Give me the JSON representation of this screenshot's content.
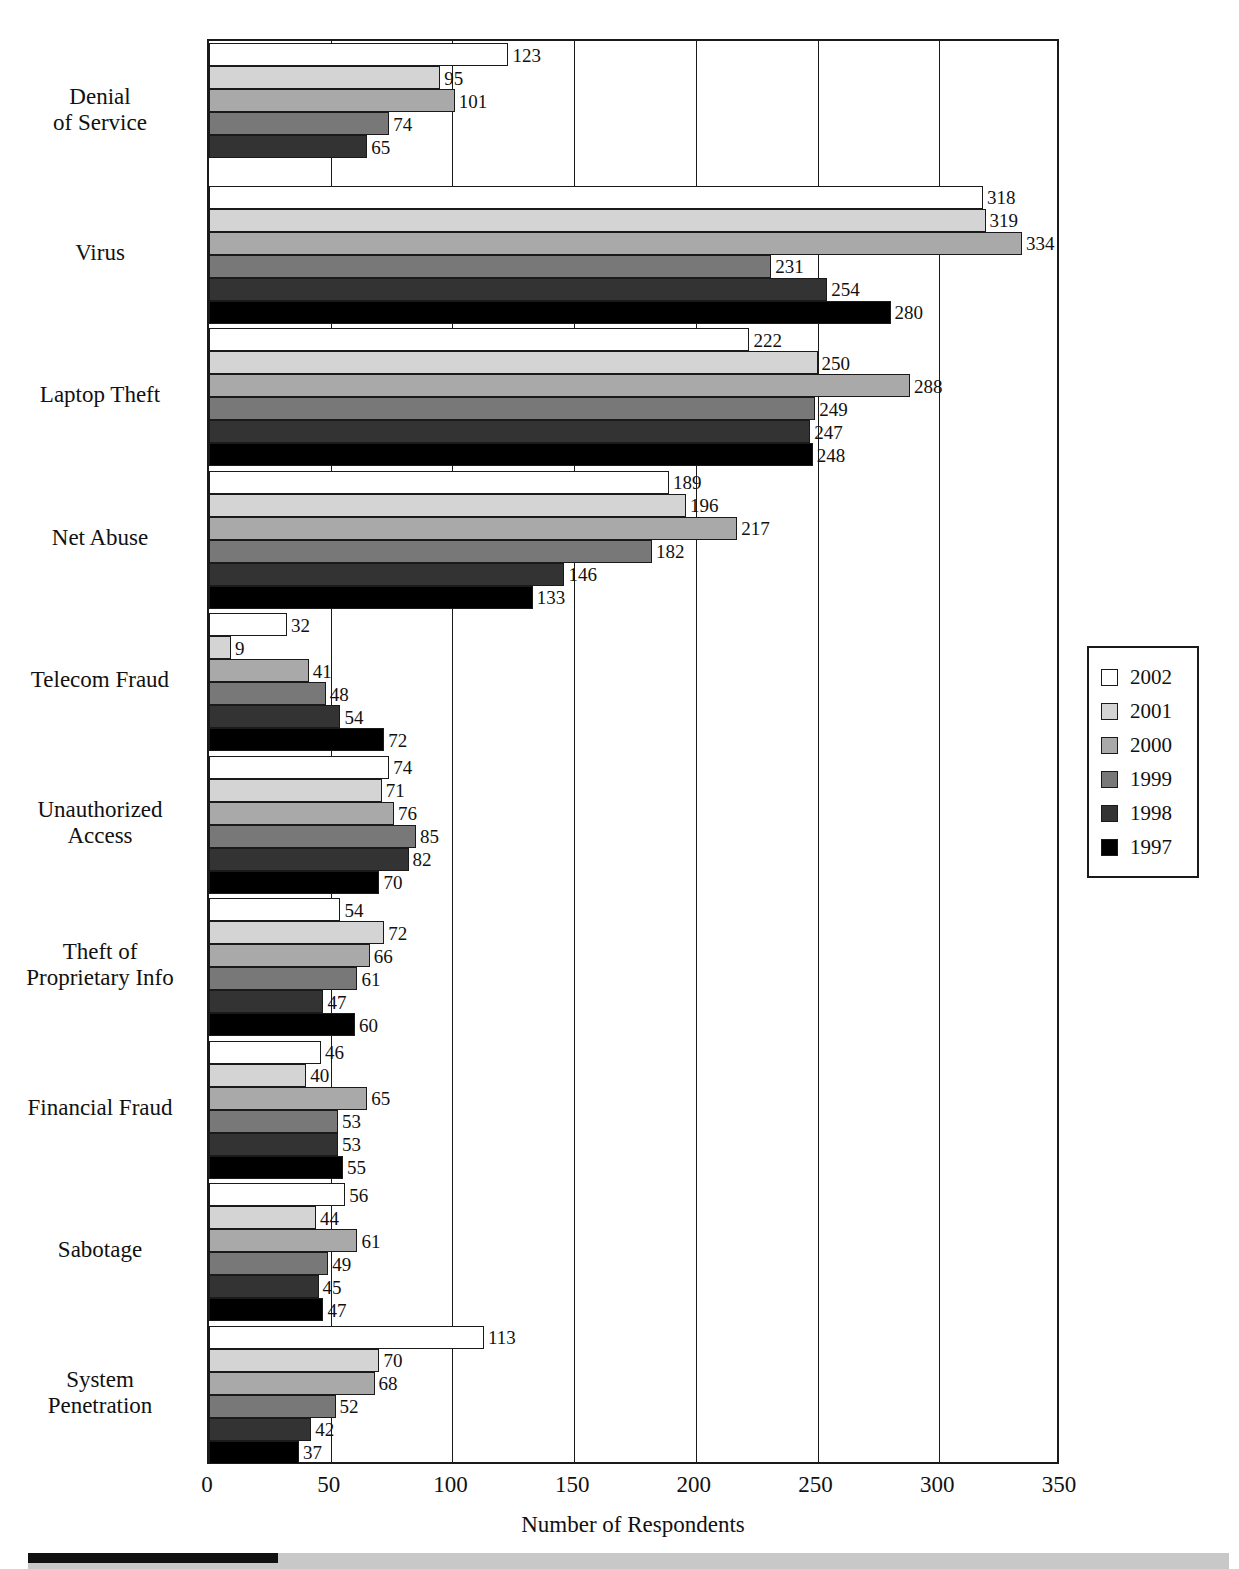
{
  "chart_data": {
    "type": "bar",
    "orientation": "horizontal",
    "grouped": true,
    "title": "",
    "xlabel": "Number of Respondents",
    "ylabel": "",
    "xlim": [
      0,
      350
    ],
    "xticks": [
      0,
      50,
      100,
      150,
      200,
      250,
      300,
      350
    ],
    "grid": true,
    "grid_axis": "x",
    "legend_position": "right",
    "categories": [
      "Denial\nof Service",
      "Virus",
      "Laptop Theft",
      "Net Abuse",
      "Telecom Fraud",
      "Unauthorized\nAccess",
      "Theft of\nProprietary Info",
      "Financial Fraud",
      "Sabotage",
      "System\nPenetration"
    ],
    "series": [
      {
        "name": "2002",
        "color": "#ffffff",
        "values": [
          123,
          318,
          222,
          189,
          32,
          74,
          54,
          46,
          56,
          113
        ]
      },
      {
        "name": "2001",
        "color": "#d4d4d4",
        "values": [
          95,
          319,
          250,
          196,
          9,
          71,
          72,
          40,
          44,
          70
        ]
      },
      {
        "name": "2000",
        "color": "#a9a9a9",
        "values": [
          101,
          334,
          288,
          217,
          41,
          76,
          66,
          65,
          61,
          68
        ]
      },
      {
        "name": "1999",
        "color": "#787878",
        "values": [
          74,
          231,
          249,
          182,
          48,
          85,
          61,
          53,
          49,
          52
        ]
      },
      {
        "name": "1998",
        "color": "#333333",
        "values": [
          65,
          254,
          247,
          146,
          54,
          82,
          47,
          53,
          45,
          42
        ]
      },
      {
        "name": "1997",
        "color": "#000000",
        "values": [
          null,
          280,
          248,
          133,
          72,
          70,
          60,
          55,
          47,
          37
        ]
      }
    ]
  },
  "axis": {
    "x_title": "Number of Respondents",
    "x_tick_labels": [
      "0",
      "50",
      "100",
      "150",
      "200",
      "250",
      "300",
      "350"
    ]
  },
  "legend": {
    "items": [
      {
        "label": "2002",
        "color": "#ffffff"
      },
      {
        "label": "2001",
        "color": "#d4d4d4"
      },
      {
        "label": "2000",
        "color": "#a9a9a9"
      },
      {
        "label": "1999",
        "color": "#787878"
      },
      {
        "label": "1998",
        "color": "#333333"
      },
      {
        "label": "1997",
        "color": "#000000"
      }
    ]
  },
  "category_labels": [
    {
      "lines": [
        "Denial",
        "of Service"
      ]
    },
    {
      "lines": [
        "Virus"
      ]
    },
    {
      "lines": [
        "Laptop Theft"
      ]
    },
    {
      "lines": [
        "Net Abuse"
      ]
    },
    {
      "lines": [
        "Telecom Fraud"
      ]
    },
    {
      "lines": [
        "Unauthorized",
        "Access"
      ]
    },
    {
      "lines": [
        "Theft of",
        "Proprietary Info"
      ]
    },
    {
      "lines": [
        "Financial Fraud"
      ]
    },
    {
      "lines": [
        "Sabotage"
      ]
    },
    {
      "lines": [
        "System",
        "Penetration"
      ]
    }
  ]
}
